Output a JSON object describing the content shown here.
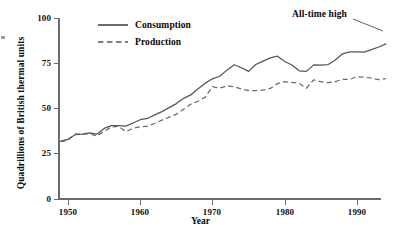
{
  "chart_data": {
    "type": "line",
    "title": "",
    "xlabel": "Year",
    "ylabel": "Quadrillions of British thermal units",
    "xlim": [
      1949,
      1994
    ],
    "ylim": [
      0,
      100
    ],
    "xticks": [
      1950,
      1960,
      1970,
      1980,
      1990
    ],
    "xtick_labels": [
      "1950",
      "1960",
      "1970",
      "1980",
      "1990"
    ],
    "yticks": [
      0,
      25,
      50,
      75,
      100
    ],
    "ytick_labels": [
      "0",
      "25",
      "50",
      "75",
      "100"
    ],
    "grid": false,
    "legend_position": "top-left-inside",
    "x": [
      1949,
      1950,
      1951,
      1952,
      1953,
      1954,
      1955,
      1956,
      1957,
      1958,
      1959,
      1960,
      1961,
      1962,
      1963,
      1964,
      1965,
      1966,
      1967,
      1968,
      1969,
      1970,
      1971,
      1972,
      1973,
      1974,
      1975,
      1976,
      1977,
      1978,
      1979,
      1980,
      1981,
      1982,
      1983,
      1984,
      1985,
      1986,
      1987,
      1988,
      1989,
      1990,
      1991,
      1992,
      1993,
      1994
    ],
    "series": [
      {
        "name": "Consumption",
        "style": "solid",
        "color": "#555555",
        "values": [
          32.0,
          33.0,
          35.5,
          35.8,
          36.5,
          35.8,
          39.0,
          40.5,
          40.5,
          40.3,
          42.0,
          43.8,
          44.5,
          46.5,
          48.3,
          50.5,
          52.7,
          55.6,
          57.5,
          60.9,
          64.0,
          66.4,
          67.8,
          71.2,
          74.2,
          72.5,
          70.5,
          74.3,
          76.2,
          78.0,
          78.9,
          76.0,
          74.0,
          70.8,
          70.5,
          74.1,
          74.0,
          74.3,
          76.8,
          80.2,
          81.3,
          81.3,
          81.1,
          82.5,
          84.0,
          85.7
        ]
      },
      {
        "name": "Production",
        "style": "dashed",
        "color": "#6a6a6a",
        "values": [
          31.7,
          32.6,
          36.0,
          35.8,
          36.0,
          34.8,
          37.4,
          39.8,
          40.1,
          37.2,
          39.1,
          39.9,
          40.3,
          41.7,
          43.6,
          45.2,
          46.9,
          49.6,
          52.4,
          54.0,
          56.3,
          62.1,
          61.3,
          62.4,
          62.1,
          60.8,
          59.9,
          59.9,
          60.2,
          61.1,
          63.8,
          64.8,
          64.4,
          63.9,
          61.2,
          65.8,
          64.8,
          64.3,
          64.9,
          66.1,
          66.1,
          67.6,
          67.3,
          66.8,
          65.9,
          66.5
        ]
      }
    ],
    "annotations": [
      {
        "text": "All-time high",
        "points_to_series": "Consumption",
        "points_to_x": 1994
      }
    ],
    "legend": [
      {
        "label": "Consumption",
        "style": "solid"
      },
      {
        "label": "Production",
        "style": "dashed"
      }
    ]
  }
}
